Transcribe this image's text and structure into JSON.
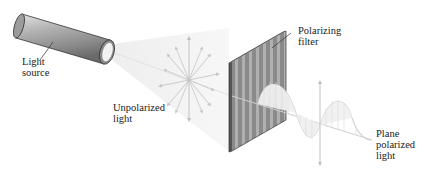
{
  "diagram": {
    "labels": {
      "light_source_line1": "Light",
      "light_source_line2": "source",
      "unpolarized_line1": "Unpolarized",
      "unpolarized_line2": "light",
      "filter_line1": "Polarizing",
      "filter_line2": "filter",
      "plane_line1": "Plane",
      "plane_line2": "polarized",
      "plane_line3": "light"
    },
    "colors": {
      "background": "#ffffff",
      "cylinder_body": "#9a9a9a",
      "cylinder_highlight": "#d8d8d8",
      "filter_dark": "#6f6f6f",
      "filter_light": "#a8a8a8",
      "beam": "#f2f2f2",
      "arrows": "#bdbdbd",
      "wave": "#d6d6d6",
      "text": "#222222"
    }
  }
}
